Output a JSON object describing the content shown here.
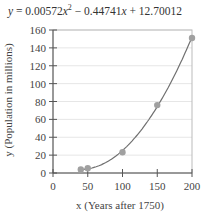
{
  "equation": {
    "lhs": "y",
    "eq": "=",
    "a": "0.00572",
    "b_sign": "−",
    "b": "0.44741",
    "c_sign": "+",
    "c": "12.70012"
  },
  "chart_data": {
    "type": "scatter",
    "xlabel": "x (Years after 1750)",
    "ylabel": "y (Population in millions)",
    "xlim": [
      0,
      200
    ],
    "ylim": [
      0,
      160
    ],
    "xticks": [
      0,
      50,
      100,
      150,
      200
    ],
    "yticks": [
      0,
      20,
      40,
      60,
      80,
      100,
      120,
      140,
      160
    ],
    "grid": true,
    "series": [
      {
        "name": "data",
        "x": [
          40,
          50,
          100,
          150,
          200
        ],
        "y": [
          3.9,
          5.3,
          23.2,
          76,
          151
        ]
      }
    ],
    "fit": {
      "type": "quadratic",
      "a": 0.00572,
      "b": -0.44741,
      "c": 12.70012,
      "x_range": [
        40,
        200
      ]
    },
    "colors": {
      "point": "#a0a0a0",
      "curve": "#707070",
      "grid": "#e6e6e6",
      "axis": "#555555"
    }
  }
}
